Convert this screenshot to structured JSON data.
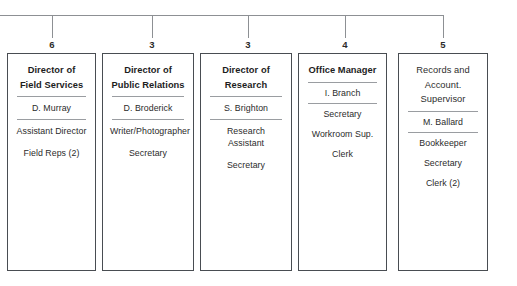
{
  "diagram": {
    "type": "organization-chart",
    "orientation": "horizontal-bus-with-vertical-drops",
    "colors": {
      "background": "#ffffff",
      "box_border": "#494d52",
      "connector_line": "#8d9094",
      "separator_rule": "#9a9da1",
      "text": "#1d1d1d"
    },
    "connector": {
      "bus_y": 15,
      "bus_x_start": 0,
      "bus_x_end": 443,
      "drop_x": [
        52,
        152,
        248,
        345,
        443
      ],
      "drop_y_end": 38
    },
    "columns": [
      {
        "id": "field-services",
        "count": "6",
        "title_lines": [
          "Director of",
          "Field Services"
        ],
        "title_bold": true,
        "rows": [
          {
            "text": "D. Murray",
            "rule_above": true
          },
          {
            "text": "Assistant Director",
            "rule_above": true
          },
          {
            "text": "Field Reps (2)",
            "rule_above": false
          }
        ],
        "x": 7,
        "width": 89
      },
      {
        "id": "public-relations",
        "count": "3",
        "title_lines": [
          "Director of",
          "Public Relations"
        ],
        "title_bold": true,
        "rows": [
          {
            "text": "D. Broderick",
            "rule_above": true
          },
          {
            "text": "Writer/Photographer",
            "rule_above": true
          },
          {
            "text": "Secretary",
            "rule_above": false
          }
        ],
        "x": 102,
        "width": 92
      },
      {
        "id": "research",
        "count": "3",
        "title_lines": [
          "Director of",
          "Research"
        ],
        "title_bold": true,
        "rows": [
          {
            "text": "S. Brighton",
            "rule_above": true
          },
          {
            "text": "Research Assistant",
            "rule_above": true
          },
          {
            "text": "Secretary",
            "rule_above": false
          }
        ],
        "x": 200,
        "width": 92
      },
      {
        "id": "office-manager",
        "count": "4",
        "title_lines": [
          "Office Manager"
        ],
        "title_bold": true,
        "rows": [
          {
            "text": "I. Branch",
            "rule_above": true
          },
          {
            "text": "Secretary",
            "rule_above": true
          },
          {
            "text": "Workroom Sup.",
            "rule_above": false
          },
          {
            "text": "Clerk",
            "rule_above": false
          }
        ],
        "x": 298,
        "width": 89
      },
      {
        "id": "records-accounting",
        "count": "5",
        "title_lines": [
          "Records and",
          "Account. Supervisor"
        ],
        "title_bold": false,
        "rows": [
          {
            "text": "M. Ballard",
            "rule_above": true
          },
          {
            "text": "Bookkeeper",
            "rule_above": true
          },
          {
            "text": "Secretary",
            "rule_above": false
          },
          {
            "text": "Clerk (2)",
            "rule_above": false
          }
        ],
        "x": 398,
        "width": 90
      }
    ]
  }
}
